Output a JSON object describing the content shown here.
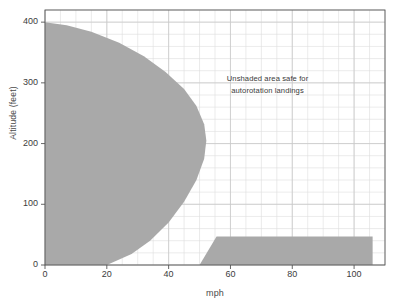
{
  "chart_data": {
    "type": "area",
    "title": "",
    "xlabel": "mph",
    "ylabel": "Altitude (feet)",
    "xlim": [
      0,
      110
    ],
    "ylim": [
      0,
      420
    ],
    "grid": true,
    "grid_minor_x_step": 5,
    "grid_minor_y_step": 20,
    "xticks": [
      0,
      20,
      40,
      60,
      80,
      100
    ],
    "xtick_labels": [
      "0",
      "20",
      "40",
      "60",
      "80",
      "100"
    ],
    "yticks": [
      0,
      100,
      200,
      300,
      400
    ],
    "ytick_labels": [
      "0",
      "100",
      "200",
      "300",
      "400"
    ],
    "legend_position": "none",
    "shaded_color": "#a9a9a9",
    "background_color": "#ffffff",
    "grid_color": "#c9c9c9",
    "axis_color": "#555555",
    "annotations": [
      {
        "name": "unshaded-area-note",
        "line1": "Unshaded area safe for",
        "line2": "autorotation landings",
        "x": 72,
        "y": 300
      }
    ],
    "series": [
      {
        "name": "High hover avoid region",
        "kind": "shaded-avoid-region",
        "points": [
          [
            0,
            400
          ],
          [
            0,
            0
          ],
          [
            20,
            0
          ],
          [
            28,
            18
          ],
          [
            34,
            40
          ],
          [
            40,
            70
          ],
          [
            45,
            104
          ],
          [
            49,
            140
          ],
          [
            51.5,
            175
          ],
          [
            52.2,
            205
          ],
          [
            51.5,
            232
          ],
          [
            49,
            262
          ],
          [
            45,
            290
          ],
          [
            39,
            318
          ],
          [
            32,
            344
          ],
          [
            24,
            366
          ],
          [
            15,
            384
          ],
          [
            7,
            395
          ],
          [
            0,
            400
          ]
        ]
      },
      {
        "name": "Low altitude high speed avoid region",
        "kind": "shaded-avoid-region",
        "points": [
          [
            50,
            0
          ],
          [
            106,
            0
          ],
          [
            106,
            47
          ],
          [
            55.5,
            47
          ],
          [
            50,
            0
          ]
        ]
      }
    ]
  }
}
